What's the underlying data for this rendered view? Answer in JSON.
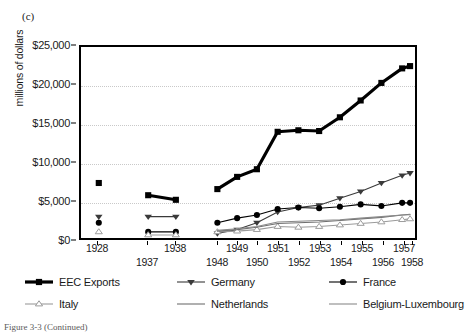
{
  "panel_label": "(c)",
  "caption": "Figure 3-3  (Continued)",
  "axes": {
    "y_title": "millions of dollars",
    "y_ticks": [
      "$0",
      "$5,000",
      "$10,000",
      "$15,000",
      "$20,000",
      "$25,000"
    ],
    "y_tick_values": [
      0,
      5000,
      10000,
      15000,
      20000,
      25000
    ],
    "x_ticks": [
      "1928",
      "1937",
      "1938",
      "1948",
      "1949",
      "1950",
      "1951",
      "1952",
      "1953",
      "1954",
      "1955",
      "1956",
      "1957",
      "1958"
    ]
  },
  "legend": {
    "items": [
      {
        "label": "EEC Exports",
        "key": "thick-square-key"
      },
      {
        "label": "Germany",
        "key": "triangle-down-key"
      },
      {
        "label": "France",
        "key": "filled-circle-key"
      },
      {
        "label": "Italy",
        "key": "open-triangle-key"
      },
      {
        "label": "Netherlands",
        "key": "plain-line-key"
      },
      {
        "label": "Belgium-Luxembourg",
        "key": "plain-line-key"
      }
    ]
  },
  "chart_data": {
    "type": "line",
    "title": "",
    "subtitle": "",
    "xlabel": "",
    "ylabel": "millions of dollars",
    "categories": [
      "1928",
      "1937",
      "1938",
      "1948",
      "1949",
      "1950",
      "1951",
      "1952",
      "1953",
      "1954",
      "1955",
      "1956",
      "1957",
      "1958"
    ],
    "ylim": [
      0,
      25000
    ],
    "yticks": [
      0,
      5000,
      10000,
      15000,
      20000,
      25000
    ],
    "grid": "horizontal-dotted",
    "legend_position": "below-plot",
    "segments": [
      [
        0
      ],
      [
        1,
        2
      ],
      [
        3,
        4,
        5,
        6,
        7,
        8,
        9,
        10,
        11,
        12,
        13
      ]
    ],
    "series": [
      {
        "name": "EEC Exports",
        "marker": "square",
        "color": "#000000",
        "line_width": 3.2,
        "values": [
          7200,
          5600,
          5000,
          6400,
          8000,
          9000,
          13900,
          14100,
          14000,
          15800,
          18000,
          20300,
          22200,
          22500
        ]
      },
      {
        "name": "Germany",
        "marker": "triangle-down",
        "color": "#3a3a3a",
        "line_width": 1.1,
        "values": [
          2800,
          2800,
          2800,
          600,
          1100,
          2000,
          3400,
          4000,
          4300,
          5200,
          6100,
          7200,
          8200,
          8500
        ]
      },
      {
        "name": "France",
        "marker": "circle",
        "color": "#000000",
        "line_width": 1.1,
        "values": [
          2000,
          800,
          800,
          2000,
          2600,
          3000,
          3800,
          4000,
          3900,
          4100,
          4400,
          4200,
          4600,
          4600
        ]
      },
      {
        "name": "Italy",
        "marker": "open-triangle",
        "color": "#9b9b9b",
        "line_width": 1.1,
        "values": [
          800,
          400,
          400,
          800,
          900,
          1100,
          1500,
          1400,
          1500,
          1700,
          1900,
          2100,
          2400,
          2500
        ]
      },
      {
        "name": "Netherlands",
        "marker": "none",
        "color": "#6f6f6f",
        "line_width": 1.1,
        "values": [
          null,
          null,
          null,
          900,
          1100,
          1400,
          1900,
          2000,
          2100,
          2300,
          2500,
          2700,
          3000,
          3100
        ]
      },
      {
        "name": "Belgium-Luxembourg",
        "marker": "none",
        "color": "#8a8a8a",
        "line_width": 1.1,
        "values": [
          null,
          null,
          null,
          1000,
          1200,
          1500,
          2100,
          2200,
          2300,
          2400,
          2600,
          2800,
          3000,
          3050
        ]
      }
    ]
  }
}
